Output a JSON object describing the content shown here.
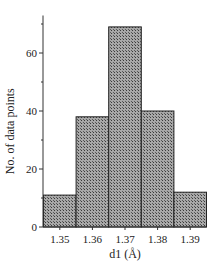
{
  "chart_data": {
    "type": "bar",
    "subtype": "histogram",
    "title": "",
    "xlabel": "d1 (Å)",
    "ylabel": "No. of data points",
    "categories": [
      "1.35",
      "1.36",
      "1.37",
      "1.38",
      "1.39"
    ],
    "values": [
      11,
      38,
      69,
      40,
      12
    ],
    "ylim": [
      0,
      75
    ],
    "yticks_major": [
      0,
      20,
      40,
      60
    ],
    "yticks_minor": [
      10,
      30,
      50,
      70
    ],
    "grid": false,
    "legend": "none",
    "bar_fill": "crosshatch",
    "colors": {
      "bar_base": "#9a9a9a",
      "bar_hatch": "#444444",
      "bar_edge": "#222222",
      "axis": "#333333"
    }
  }
}
